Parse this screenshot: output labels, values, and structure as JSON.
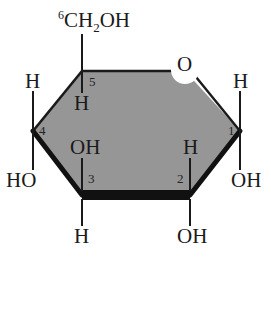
{
  "diagram": {
    "ring": {
      "ring_oxygen_label": "O",
      "fill_color": "#969696",
      "outline_color": "#1a1a1a",
      "front_edge_color": "#111111"
    },
    "carbon_numbers": {
      "c1": "1",
      "c2": "2",
      "c3": "3",
      "c4": "4",
      "c5": "5",
      "c6": "6"
    },
    "substituents": {
      "c6_group": "CH",
      "c6_subscript": "2",
      "c6_tail": "OH",
      "c5_down": "H",
      "c4_up": "H",
      "c4_down": "HO",
      "c3_up": "OH",
      "c3_down": "H",
      "c2_up": "H",
      "c2_down": "OH",
      "c1_up": "H",
      "c1_down": "OH"
    }
  }
}
